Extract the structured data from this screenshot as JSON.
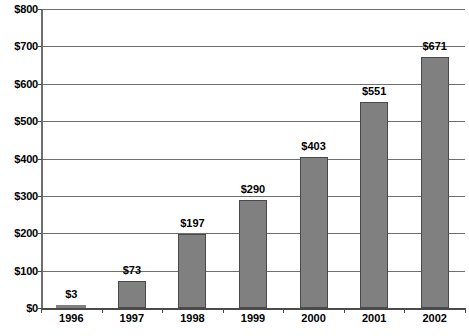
{
  "chart_data": {
    "type": "bar",
    "title": "",
    "subtitle": "",
    "xlabel": "",
    "ylabel": "",
    "categories": [
      "1996",
      "1997",
      "1998",
      "1999",
      "2000",
      "2001",
      "2002"
    ],
    "values": [
      3,
      73,
      197,
      290,
      403,
      551,
      671
    ],
    "data_labels": [
      "$3",
      "$73",
      "$197",
      "$290",
      "$403",
      "$551",
      "$671"
    ],
    "ylim": [
      0,
      800
    ],
    "ytick_values": [
      0,
      100,
      200,
      300,
      400,
      500,
      600,
      700,
      800
    ],
    "ytick_labels": [
      "$0",
      "$100",
      "$200",
      "$300",
      "$400",
      "$500",
      "$600",
      "$700",
      "$800"
    ],
    "grid": true,
    "legend": false,
    "legend_position": "none",
    "bar_color": "#808080",
    "bar_outline_color": "#4a4a4a",
    "gridline_color": "#6e6e6e",
    "axis_color": "#4a4a4a",
    "background_color": "#ffffff",
    "text_color": "#000000"
  }
}
